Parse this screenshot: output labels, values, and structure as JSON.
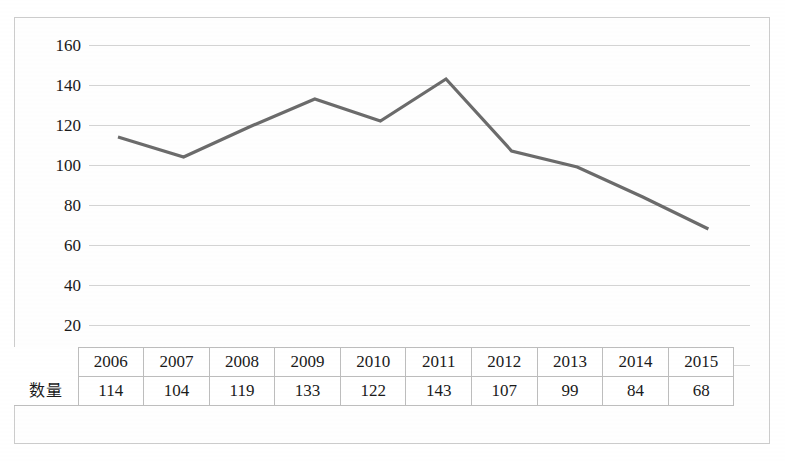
{
  "chart_data": {
    "type": "line",
    "title": "",
    "xlabel": "",
    "ylabel": "",
    "categories": [
      "2006",
      "2007",
      "2008",
      "2009",
      "2010",
      "2011",
      "2012",
      "2013",
      "2014",
      "2015"
    ],
    "values": [
      114,
      104,
      119,
      133,
      122,
      143,
      107,
      99,
      84,
      68
    ],
    "series": [
      {
        "name": "数量",
        "values": [
          114,
          104,
          119,
          133,
          122,
          143,
          107,
          99,
          84,
          68
        ]
      }
    ],
    "ylim": [
      0,
      160
    ],
    "ytick_labels": [
      "160",
      "140",
      "120",
      "100",
      "80",
      "60",
      "40",
      "20",
      "0"
    ],
    "ytick_values": [
      160,
      140,
      120,
      100,
      80,
      60,
      40,
      20,
      0
    ],
    "grid": true,
    "legend": false,
    "legend_position": "none",
    "has_data_table": true,
    "line_color": "#6b6b6b",
    "grid_color": "#d3d3d3",
    "border_color": "#cccccc",
    "text_color": "#1a1a1a"
  },
  "table": {
    "row_header_label": "数量",
    "column_headers": [
      "2006",
      "2007",
      "2008",
      "2009",
      "2010",
      "2011",
      "2012",
      "2013",
      "2014",
      "2015"
    ],
    "row_values": [
      "114",
      "104",
      "119",
      "133",
      "122",
      "143",
      "107",
      "99",
      "84",
      "68"
    ]
  }
}
